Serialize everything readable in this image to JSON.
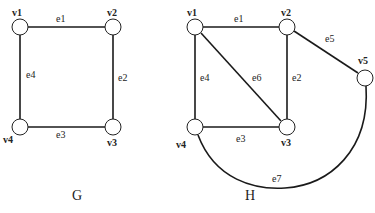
{
  "graphs": [
    {
      "name": "G",
      "caption": "G",
      "vertices": [
        {
          "id": "v1",
          "label": "v1",
          "x": 20,
          "y": 27
        },
        {
          "id": "v2",
          "label": "v2",
          "x": 113,
          "y": 27
        },
        {
          "id": "v3",
          "label": "v3",
          "x": 113,
          "y": 127
        },
        {
          "id": "v4",
          "label": "v4",
          "x": 20,
          "y": 127
        }
      ],
      "edges": [
        {
          "id": "e1",
          "label": "e1",
          "from": "v1",
          "to": "v2"
        },
        {
          "id": "e2",
          "label": "e2",
          "from": "v2",
          "to": "v3"
        },
        {
          "id": "e3",
          "label": "e3",
          "from": "v4",
          "to": "v3"
        },
        {
          "id": "e4",
          "label": "e4",
          "from": "v1",
          "to": "v4"
        }
      ]
    },
    {
      "name": "H",
      "caption": "H",
      "vertices": [
        {
          "id": "v1",
          "label": "v1",
          "x": 195,
          "y": 27
        },
        {
          "id": "v2",
          "label": "v2",
          "x": 287,
          "y": 27
        },
        {
          "id": "v3",
          "label": "v3",
          "x": 287,
          "y": 127
        },
        {
          "id": "v4",
          "label": "v4",
          "x": 195,
          "y": 127
        },
        {
          "id": "v5",
          "label": "v5",
          "x": 365,
          "y": 78
        }
      ],
      "edges": [
        {
          "id": "e1",
          "label": "e1",
          "from": "v1",
          "to": "v2"
        },
        {
          "id": "e2",
          "label": "e2",
          "from": "v2",
          "to": "v3"
        },
        {
          "id": "e3",
          "label": "e3",
          "from": "v4",
          "to": "v3"
        },
        {
          "id": "e4",
          "label": "e4",
          "from": "v1",
          "to": "v4"
        },
        {
          "id": "e5",
          "label": "e5",
          "from": "v2",
          "to": "v5"
        },
        {
          "id": "e6",
          "label": "e6",
          "from": "v1",
          "to": "v3"
        },
        {
          "id": "e7",
          "label": "e7",
          "from": "v4",
          "to": "v5",
          "curved": true
        }
      ]
    }
  ]
}
